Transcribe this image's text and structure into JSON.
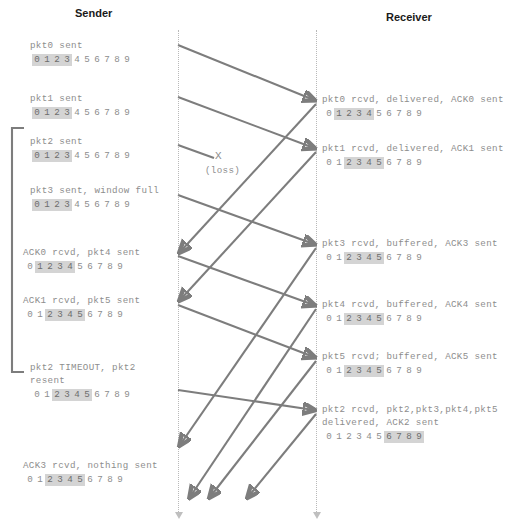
{
  "headers": {
    "sender": "Sender",
    "receiver": "Receiver"
  },
  "loss": {
    "mark": "X",
    "label": "(loss)"
  },
  "sequence_digits": [
    "0",
    "1",
    "2",
    "3",
    "4",
    "5",
    "6",
    "7",
    "8",
    "9"
  ],
  "sender_events": [
    {
      "name": "pkt0-sent",
      "lines": [
        "pkt0 sent"
      ],
      "window": [
        0,
        3
      ],
      "x": 30,
      "y": 40
    },
    {
      "name": "pkt1-sent",
      "lines": [
        "pkt1 sent"
      ],
      "window": [
        0,
        3
      ],
      "x": 30,
      "y": 93
    },
    {
      "name": "pkt2-sent",
      "lines": [
        "pkt2 sent"
      ],
      "window": [
        0,
        3
      ],
      "x": 30,
      "y": 136
    },
    {
      "name": "pkt3-sent",
      "lines": [
        "pkt3 sent, window full"
      ],
      "window": [
        0,
        3
      ],
      "x": 30,
      "y": 185
    },
    {
      "name": "ack0-rcvd",
      "lines": [
        "ACK0 rcvd, pkt4 sent"
      ],
      "window": [
        1,
        4
      ],
      "x": 23,
      "y": 247
    },
    {
      "name": "ack1-rcvd",
      "lines": [
        "ACK1 rcvd, pkt5 sent"
      ],
      "window": [
        2,
        5
      ],
      "x": 23,
      "y": 295
    },
    {
      "name": "pkt2-timeout",
      "lines": [
        "pkt2 TIMEOUT, pkt2",
        "resent"
      ],
      "window": [
        2,
        5
      ],
      "x": 30,
      "y": 362
    },
    {
      "name": "ack3-rcvd",
      "lines": [
        "ACK3 rcvd, nothing sent"
      ],
      "window": [
        2,
        5
      ],
      "x": 23,
      "y": 460
    }
  ],
  "receiver_events": [
    {
      "name": "pkt0-rcvd",
      "lines": [
        "pkt0 rcvd, delivered, ACK0 sent"
      ],
      "window": [
        1,
        4
      ],
      "x": 322,
      "y": 94
    },
    {
      "name": "pkt1-rcvd",
      "lines": [
        "pkt1 rcvd, delivered, ACK1 sent"
      ],
      "window": [
        2,
        5
      ],
      "x": 322,
      "y": 143
    },
    {
      "name": "pkt3-rcvd",
      "lines": [
        "pkt3 rcvd, buffered, ACK3 sent"
      ],
      "window": [
        2,
        5
      ],
      "x": 322,
      "y": 238
    },
    {
      "name": "pkt4-rcvd",
      "lines": [
        "pkt4 rcvd, buffered, ACK4 sent"
      ],
      "window": [
        2,
        5
      ],
      "x": 322,
      "y": 299
    },
    {
      "name": "pkt5-rcvd",
      "lines": [
        "pkt5 rcvd; buffered, ACK5 sent"
      ],
      "window": [
        2,
        5
      ],
      "x": 322,
      "y": 351
    },
    {
      "name": "pkt2-rcvd",
      "lines": [
        "pkt2 rcvd, pkt2,pkt3,pkt4,pkt5",
        "delivered, ACK2 sent"
      ],
      "window": [
        6,
        9
      ],
      "x": 322,
      "y": 404
    }
  ],
  "timelines": {
    "sender_x": 178,
    "receiver_x": 316,
    "top_y": 30,
    "bottom_y": 512
  },
  "arrows": [
    {
      "name": "pkt0-transit",
      "x1": 178,
      "y1": 45,
      "x2": 314,
      "y2": 100
    },
    {
      "name": "pkt1-transit",
      "x1": 178,
      "y1": 97,
      "x2": 314,
      "y2": 148
    },
    {
      "name": "pkt2-lost",
      "x1": 178,
      "y1": 145,
      "x2": 214,
      "y2": 158,
      "head": false
    },
    {
      "name": "pkt3-transit",
      "x1": 178,
      "y1": 195,
      "x2": 314,
      "y2": 244
    },
    {
      "name": "ack0-return",
      "x1": 316,
      "y1": 104,
      "x2": 180,
      "y2": 252
    },
    {
      "name": "ack1-return",
      "x1": 316,
      "y1": 152,
      "x2": 180,
      "y2": 300
    },
    {
      "name": "pkt4-transit",
      "x1": 178,
      "y1": 256,
      "x2": 314,
      "y2": 305
    },
    {
      "name": "pkt5-transit",
      "x1": 178,
      "y1": 305,
      "x2": 314,
      "y2": 357
    },
    {
      "name": "ack3-return",
      "x1": 316,
      "y1": 248,
      "x2": 180,
      "y2": 445
    },
    {
      "name": "pkt2-resent",
      "x1": 178,
      "y1": 390,
      "x2": 314,
      "y2": 410
    },
    {
      "name": "ack4-return",
      "x1": 316,
      "y1": 309,
      "x2": 190,
      "y2": 497
    },
    {
      "name": "ack5-return",
      "x1": 316,
      "y1": 361,
      "x2": 210,
      "y2": 497
    },
    {
      "name": "ack2-return",
      "x1": 316,
      "y1": 414,
      "x2": 248,
      "y2": 497
    }
  ],
  "timeout_bracket": {
    "name": "pkt2-timeout-bracket",
    "x": 12,
    "top_y": 128,
    "bottom_y": 372,
    "tick": 12
  }
}
